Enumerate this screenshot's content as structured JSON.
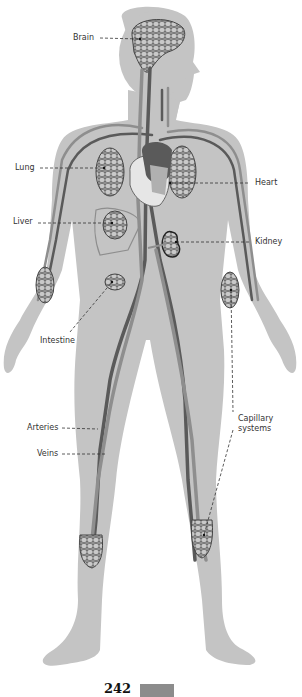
{
  "figure": {
    "colors": {
      "body": "#c4c4c4",
      "artery": "#5a5a5a",
      "vein": "#8e8e8e",
      "capillary": "#444444",
      "heart_inner": "#e6e6e6"
    },
    "labels": [
      {
        "id": "brain",
        "text": "Brain"
      },
      {
        "id": "lung",
        "text": "Lung"
      },
      {
        "id": "heart",
        "text": "Heart"
      },
      {
        "id": "liver",
        "text": "Liver"
      },
      {
        "id": "kidney",
        "text": "Kidney"
      },
      {
        "id": "intestine",
        "text": "Intestine"
      },
      {
        "id": "arteries",
        "text": "Arteries"
      },
      {
        "id": "veins",
        "text": "Veins"
      },
      {
        "id": "capillary",
        "text": "Capillary\nsystems"
      }
    ]
  },
  "page": {
    "number": "242"
  }
}
